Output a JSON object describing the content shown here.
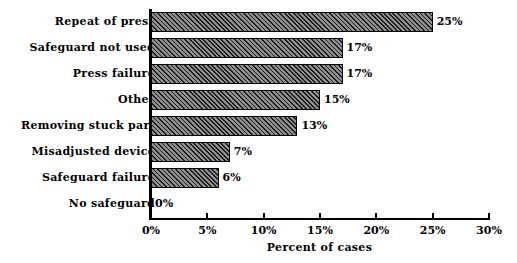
{
  "chart_data": {
    "type": "bar",
    "orientation": "horizontal",
    "title": "",
    "subtitle": "",
    "xlabel": "Percent of cases",
    "ylabel": "",
    "categories": [
      "Repeat of press",
      "Safeguard not used",
      "Press failure",
      "Other",
      "Removing stuck part",
      "Misadjusted device",
      "Safeguard failure",
      "No safeguard"
    ],
    "values": [
      25,
      17,
      17,
      15,
      13,
      7,
      6,
      0
    ],
    "value_labels": [
      "25%",
      "17%",
      "17%",
      "15%",
      "13%",
      "7%",
      "6%",
      "0%"
    ],
    "xlim": [
      0,
      30
    ],
    "xticks": [
      0,
      5,
      10,
      15,
      20,
      25,
      30
    ],
    "xtick_labels": [
      "0%",
      "5%",
      "10%",
      "15%",
      "20%",
      "25%",
      "30%"
    ],
    "grid": false,
    "legend": false,
    "bar_fill": "#5a5a5a",
    "bar_hatch": "diagonal",
    "bar_edge_color": "#000000",
    "background": "#ffffff",
    "text_color": "#000000"
  }
}
